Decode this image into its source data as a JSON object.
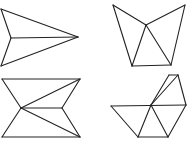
{
  "canvas": {
    "width": 187,
    "height": 144,
    "background": "#ffffff",
    "stroke": "#222222"
  },
  "figures": [
    {
      "name": "arrowhead-figure",
      "points": {
        "A": [
          1,
          9
        ],
        "B": [
          11,
          38
        ],
        "C": [
          1,
          66
        ],
        "D": [
          78,
          37
        ]
      },
      "edges": [
        [
          "A",
          "D"
        ],
        [
          "A",
          "B"
        ],
        [
          "B",
          "C"
        ],
        [
          "C",
          "D"
        ],
        [
          "B",
          "D"
        ]
      ]
    },
    {
      "name": "cup-figure",
      "points": {
        "A": [
          113,
          5
        ],
        "B": [
          146,
          25
        ],
        "C": [
          185,
          5
        ],
        "D": [
          132,
          66
        ],
        "E": [
          171,
          65
        ]
      },
      "edges": [
        [
          "A",
          "B"
        ],
        [
          "B",
          "C"
        ],
        [
          "A",
          "D"
        ],
        [
          "C",
          "E"
        ],
        [
          "D",
          "E"
        ],
        [
          "B",
          "D"
        ],
        [
          "B",
          "E"
        ]
      ]
    },
    {
      "name": "bowtie-figure",
      "points": {
        "A": [
          2,
          79
        ],
        "B": [
          80,
          79
        ],
        "C": [
          21,
          108
        ],
        "D": [
          62,
          108
        ],
        "E": [
          2,
          137
        ],
        "F": [
          80,
          137
        ]
      },
      "edges": [
        [
          "A",
          "B"
        ],
        [
          "E",
          "F"
        ],
        [
          "A",
          "C"
        ],
        [
          "C",
          "E"
        ],
        [
          "B",
          "D"
        ],
        [
          "D",
          "F"
        ],
        [
          "C",
          "B"
        ],
        [
          "C",
          "D"
        ],
        [
          "C",
          "F"
        ]
      ]
    },
    {
      "name": "sail-figure",
      "points": {
        "A": [
          111,
          106
        ],
        "B": [
          151,
          105
        ],
        "C": [
          186,
          105
        ],
        "D": [
          169,
          75
        ],
        "E": [
          178,
          75
        ],
        "F": [
          138,
          137
        ],
        "G": [
          168,
          137
        ]
      },
      "edges": [
        [
          "A",
          "C"
        ],
        [
          "D",
          "E"
        ],
        [
          "B",
          "D"
        ],
        [
          "B",
          "E"
        ],
        [
          "E",
          "C"
        ],
        [
          "A",
          "F"
        ],
        [
          "F",
          "G"
        ],
        [
          "B",
          "F"
        ],
        [
          "B",
          "G"
        ],
        [
          "G",
          "C"
        ]
      ]
    }
  ]
}
